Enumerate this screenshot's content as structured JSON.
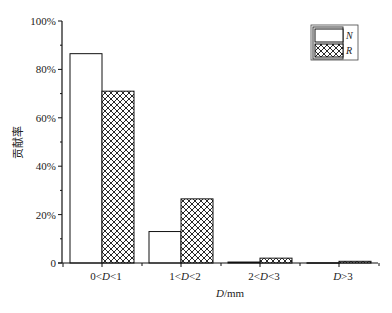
{
  "chart_data": {
    "type": "bar",
    "title": "",
    "xlabel": "D/mm",
    "ylabel": "贡献率",
    "categories": [
      "0<D<1",
      "1<D<2",
      "2<D<3",
      "D>3"
    ],
    "series": [
      {
        "name": "N",
        "fill": "white",
        "values": [
          86.5,
          13.0,
          0.4,
          0.1
        ]
      },
      {
        "name": "R",
        "fill": "crosshatch",
        "values": [
          71.0,
          26.5,
          2.0,
          0.7
        ]
      }
    ],
    "ylim": [
      0,
      100
    ],
    "yticks": [
      "0",
      "20%",
      "40%",
      "60%",
      "80%",
      "100%"
    ],
    "grid": false,
    "legend_position": "upper-right"
  },
  "axis": {
    "ylabel": "贡献率",
    "xlabel_italic": "D",
    "xlabel_unit": "/mm"
  },
  "legend": {
    "n_label": "N",
    "r_label": "R"
  }
}
